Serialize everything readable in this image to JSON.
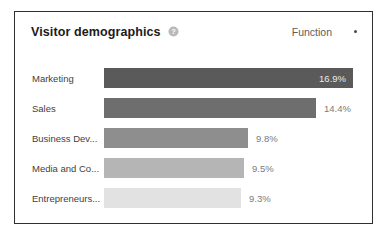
{
  "card": {
    "title": "Visitor demographics",
    "help_icon": "help-circle-icon",
    "function_label": "Function",
    "caret_icon": "dropdown-caret-icon",
    "border_color": "#2f2f2f",
    "background": "#ffffff"
  },
  "chart_data": {
    "type": "bar",
    "orientation": "horizontal",
    "title": "Visitor demographics",
    "xlabel": "",
    "ylabel": "",
    "grid": false,
    "legend": "none",
    "xlim": [
      0,
      17.8
    ],
    "categories": [
      "Marketing",
      "Sales",
      "Business Dev...",
      "Media and Co...",
      "Entrepreneurs..."
    ],
    "values": [
      16.9,
      14.4,
      9.8,
      9.5,
      9.3
    ],
    "value_labels": [
      "16.9%",
      "14.4%",
      "9.8%",
      "9.5%",
      "9.3%"
    ],
    "label_placement": [
      "inside",
      "outside",
      "outside",
      "outside",
      "outside"
    ],
    "bar_colors": [
      "#5a5a5a",
      "#6e6e6e",
      "#8e8e8e",
      "#b5b5b5",
      "#e2e2e2"
    ]
  }
}
